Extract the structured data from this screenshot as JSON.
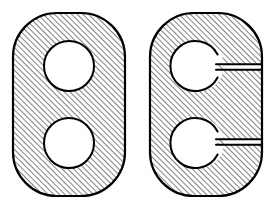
{
  "canvas": {
    "width": 277,
    "height": 211,
    "background": "#ffffff",
    "caption": ""
  },
  "style": {
    "outline_color": "#000000",
    "outline_width": 2.2,
    "inner_outline_width": 2.0,
    "hatch_color": "#1a1a1a",
    "hatch_angle_deg": 45,
    "hatch_spacing": 4,
    "hatch_stroke_width": 1.1,
    "fill_color": "#ffffff"
  },
  "figures": [
    {
      "id": "left-figure",
      "name": "solid-stadium-plate-with-two-holes",
      "label": "",
      "outline": {
        "shape": "rounded-rectangle",
        "x": 13,
        "y": 13,
        "width": 112,
        "height": 183,
        "corner_radius": 44
      },
      "holes": [
        {
          "id": "left-upper-hole",
          "shape": "circle",
          "cx": 69,
          "cy": 66,
          "r": 25
        },
        {
          "id": "left-lower-hole",
          "shape": "circle",
          "cx": 69,
          "cy": 143,
          "r": 25
        }
      ],
      "slots": []
    },
    {
      "id": "right-figure",
      "name": "slotted-stadium-plate-with-two-holes",
      "label": "",
      "outline": {
        "shape": "rounded-rectangle",
        "x": 150,
        "y": 13,
        "width": 112,
        "height": 183,
        "corner_radius": 44
      },
      "holes": [
        {
          "id": "right-upper-hole",
          "shape": "circle",
          "cx": 199,
          "cy": 66,
          "r": 25
        },
        {
          "id": "right-lower-hole",
          "shape": "circle",
          "cx": 199,
          "cy": 143,
          "r": 25
        }
      ],
      "slots": [
        {
          "id": "right-upper-slot",
          "shape": "rectangle",
          "x": 199,
          "y": 64.5,
          "width": 63,
          "height": 5,
          "connects": "right-upper-hole",
          "opens_to": "right-edge"
        },
        {
          "id": "right-lower-slot",
          "shape": "rectangle",
          "x": 199,
          "y": 139.5,
          "width": 63,
          "height": 5,
          "connects": "right-lower-hole",
          "opens_to": "right-edge"
        }
      ]
    }
  ]
}
